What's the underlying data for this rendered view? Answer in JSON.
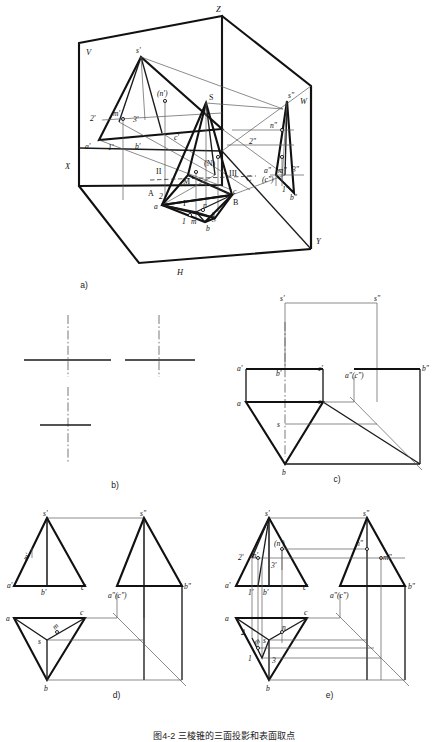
{
  "page": {
    "background": "#ffffff",
    "ink": "#111111",
    "figure_title": "图4-2  三棱锥的三面投影和表面取点"
  },
  "figures": {
    "a": {
      "caption": "a)",
      "axis_labels": {
        "x": "X",
        "y": "Y",
        "z": "Z",
        "v": "V",
        "w": "W",
        "h": "H"
      },
      "v_projection": {
        "apex": "s'",
        "points": [
          "2'",
          "m'",
          "3'",
          "(n')",
          "a'",
          "1'",
          "b'",
          "c'"
        ]
      },
      "space_object": {
        "apex": "S",
        "points": [
          "(N)",
          "II",
          "M",
          "III",
          "A",
          "B",
          "C",
          "I"
        ]
      },
      "w_projection": {
        "apex": "s\"",
        "points": [
          "n\"",
          "2\"",
          "a\"",
          "m\"",
          "3\"",
          "(c\")",
          "1\"",
          "b\""
        ]
      },
      "h_projection": {
        "points": [
          "a",
          "2",
          "1",
          "m",
          "n",
          "s",
          "3",
          "b",
          "c"
        ]
      }
    },
    "b": {
      "caption": "b)",
      "description": "three centre-line crosses (axis marks)",
      "crosses": 3
    },
    "c": {
      "caption": "c)",
      "v_projection": {
        "apex": "s'",
        "points": [
          "a'",
          "b'",
          "c'"
        ]
      },
      "w_projection": {
        "apex": "s\"",
        "points": [
          "a\"(c\")",
          "b\""
        ]
      },
      "h_projection": {
        "points": [
          "a",
          "s",
          "c",
          "b"
        ]
      }
    },
    "d": {
      "caption": "d)",
      "v_projection": {
        "apex": "s'",
        "points": [
          "a'",
          "m'",
          "b'",
          "c'"
        ]
      },
      "w_projection": {
        "apex": "s\"",
        "points": [
          "a\"(c\")",
          "b\""
        ]
      },
      "h_projection": {
        "points": [
          "a",
          "s",
          "m",
          "c",
          "b"
        ]
      }
    },
    "e": {
      "caption": "e)",
      "v_projection": {
        "apex": "s'",
        "points": [
          "2'",
          "m'",
          "(n')",
          "3'",
          "a'",
          "1'",
          "b'",
          "c'"
        ]
      },
      "w_projection": {
        "apex": "s\"",
        "points": [
          "n\"",
          "m\"",
          "a\"(c\")",
          "b\""
        ]
      },
      "h_projection": {
        "points": [
          "a",
          "c",
          "n",
          "s",
          "2",
          "m",
          "1",
          "3",
          "b"
        ]
      }
    }
  }
}
